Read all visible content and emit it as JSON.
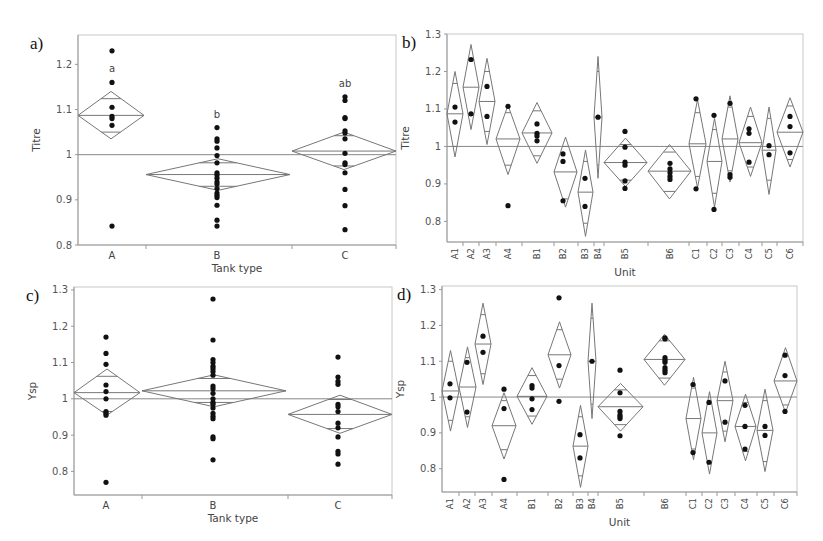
{
  "figure": {
    "panels": [
      "a)",
      "b)",
      "c)",
      "d)"
    ]
  },
  "chart_data": [
    {
      "id": "a",
      "panel_label": "a)",
      "type": "scatter",
      "subtype": "means-diamonds",
      "title": "",
      "xlabel": "Tank type",
      "ylabel": "Titre",
      "ylim": [
        0.8,
        1.26
      ],
      "yticks": [
        {
          "v": 0.8,
          "label": "0.8"
        },
        {
          "v": 0.9,
          "label": "0.9"
        },
        {
          "v": 1.0,
          "label": "1"
        },
        {
          "v": 1.1,
          "label": "1.1"
        },
        {
          "v": 1.2,
          "label": "1.2"
        }
      ],
      "reference_line": 1.0,
      "grid": false,
      "box": {
        "x0": 78,
        "x1": 396,
        "y0": 35,
        "y1": 245,
        "yTop": 1.265,
        "yBot": 0.8
      },
      "categories": [
        {
          "label": "A",
          "sig": "a",
          "cx": 112,
          "left": 78,
          "right": 144,
          "mean": 1.087,
          "ci": [
            1.035,
            1.14
          ],
          "inner": [
            1.05,
            1.124
          ],
          "points": [
            1.23,
            1.16,
            1.105,
            1.085,
            1.08,
            1.065,
            0.842
          ]
        },
        {
          "label": "B",
          "sig": "b",
          "cx": 217,
          "left": 146,
          "right": 290,
          "mean": 0.956,
          "ci": [
            0.921,
            0.991
          ],
          "inner": [
            0.93,
            0.982
          ],
          "points": [
            1.06,
            1.035,
            1.03,
            1.015,
            0.998,
            0.982,
            0.96,
            0.955,
            0.948,
            0.94,
            0.935,
            0.925,
            0.915,
            0.91,
            0.905,
            0.888,
            0.855,
            0.842
          ]
        },
        {
          "label": "C",
          "sig": "ab",
          "cx": 345,
          "left": 292,
          "right": 396,
          "mean": 1.008,
          "ci": [
            0.967,
            1.05
          ],
          "inner": [
            0.975,
            1.042
          ],
          "points": [
            1.128,
            1.12,
            1.082,
            1.08,
            1.053,
            1.048,
            1.035,
            1.003,
            0.982,
            0.978,
            0.96,
            0.923,
            0.887,
            0.834
          ]
        }
      ]
    },
    {
      "id": "b",
      "panel_label": "b)",
      "type": "scatter",
      "subtype": "means-diamonds",
      "title": "",
      "xlabel": "Unit",
      "ylabel": "Titre",
      "ylim": [
        0.75,
        1.3
      ],
      "yticks": [
        {
          "v": 0.8,
          "label": "0.8"
        },
        {
          "v": 0.9,
          "label": "0.9"
        },
        {
          "v": 1.0,
          "label": "1"
        },
        {
          "v": 1.1,
          "label": "1.1"
        },
        {
          "v": 1.2,
          "label": "1.2"
        },
        {
          "v": 1.3,
          "label": "1.3"
        }
      ],
      "reference_line": 1.0,
      "grid": false,
      "box": {
        "x0": 447,
        "x1": 803,
        "y0": 34,
        "y1": 242,
        "yTop": 1.3,
        "yBot": 0.745
      },
      "categories": [
        {
          "label": "A1",
          "cx": 455,
          "left": 447,
          "right": 463,
          "mean": 1.087,
          "ci": [
            0.972,
            1.2
          ],
          "inner": [
            1.0,
            1.168
          ],
          "points": [
            1.105,
            1.065
          ]
        },
        {
          "label": "A2",
          "cx": 471,
          "left": 463,
          "right": 479,
          "mean": 1.158,
          "ci": [
            1.045,
            1.272
          ],
          "inner": [
            1.085,
            1.23
          ],
          "points": [
            1.232,
            1.087
          ]
        },
        {
          "label": "A3",
          "cx": 487,
          "left": 479,
          "right": 495,
          "mean": 1.12,
          "ci": [
            1.005,
            1.235
          ],
          "inner": [
            1.04,
            1.2
          ],
          "points": [
            1.16,
            1.08
          ]
        },
        {
          "label": "A4",
          "cx": 508,
          "left": 496,
          "right": 520,
          "mean": 1.02,
          "ci": [
            0.925,
            1.11
          ],
          "inner": [
            0.95,
            1.09
          ],
          "points": [
            1.107,
            0.842
          ]
        },
        {
          "label": "B1",
          "cx": 537,
          "left": 522,
          "right": 552,
          "mean": 1.036,
          "ci": [
            0.955,
            1.117
          ],
          "inner": [
            0.975,
            1.095
          ],
          "points": [
            1.06,
            1.035,
            1.028,
            1.015
          ]
        },
        {
          "label": "B2",
          "cx": 563,
          "left": 554,
          "right": 577,
          "mean": 0.932,
          "ci": [
            0.838,
            1.025
          ],
          "inner": [
            0.86,
            1.0
          ],
          "points": [
            0.98,
            0.96,
            0.855
          ]
        },
        {
          "label": "B3",
          "cx": 585,
          "left": 578,
          "right": 593,
          "mean": 0.878,
          "ci": [
            0.76,
            0.99
          ],
          "inner": [
            0.795,
            0.96
          ],
          "points": [
            0.915,
            0.84
          ]
        },
        {
          "label": "B4",
          "cx": 598,
          "left": 594,
          "right": 602,
          "mean": 1.078,
          "ci": [
            0.915,
            1.24
          ],
          "inner": [
            0.95,
            1.2
          ],
          "points": [
            1.078
          ]
        },
        {
          "label": "B5",
          "cx": 625,
          "left": 604,
          "right": 647,
          "mean": 0.957,
          "ci": [
            0.893,
            1.022
          ],
          "inner": [
            0.91,
            1.005
          ],
          "points": [
            1.04,
            0.998,
            0.958,
            0.95,
            0.908,
            0.888
          ]
        },
        {
          "label": "B6",
          "cx": 670,
          "left": 648,
          "right": 691,
          "mean": 0.934,
          "ci": [
            0.86,
            1.005
          ],
          "inner": [
            0.88,
            0.985
          ],
          "points": [
            0.955,
            0.94,
            0.93,
            0.92,
            0.912
          ]
        },
        {
          "label": "C1",
          "cx": 696,
          "left": 689,
          "right": 706,
          "mean": 1.007,
          "ci": [
            0.89,
            1.125
          ],
          "inner": [
            0.92,
            1.09
          ],
          "points": [
            1.127,
            0.887
          ]
        },
        {
          "label": "C2",
          "cx": 714,
          "left": 707,
          "right": 722,
          "mean": 0.96,
          "ci": [
            0.838,
            1.075
          ],
          "inner": [
            0.875,
            1.045
          ],
          "points": [
            1.083,
            0.832
          ]
        },
        {
          "label": "C3",
          "cx": 730,
          "left": 722,
          "right": 738,
          "mean": 1.02,
          "ci": [
            0.905,
            1.135
          ],
          "inner": [
            0.935,
            1.105
          ],
          "points": [
            1.115,
            0.925,
            0.918
          ]
        },
        {
          "label": "C4",
          "cx": 749,
          "left": 739,
          "right": 762,
          "mean": 1.01,
          "ci": [
            0.92,
            1.105
          ],
          "inner": [
            0.945,
            1.08
          ],
          "points": [
            1.047,
            1.035,
            0.958
          ]
        },
        {
          "label": "C5",
          "cx": 769,
          "left": 762,
          "right": 776,
          "mean": 0.99,
          "ci": [
            0.872,
            1.105
          ],
          "inner": [
            0.91,
            1.075
          ],
          "points": [
            1.002,
            0.978
          ]
        },
        {
          "label": "C6",
          "cx": 790,
          "left": 777,
          "right": 803,
          "mean": 1.038,
          "ci": [
            0.945,
            1.13
          ],
          "inner": [
            0.965,
            1.108
          ],
          "points": [
            1.08,
            1.053,
            0.983
          ]
        }
      ]
    },
    {
      "id": "c",
      "panel_label": "c)",
      "type": "scatter",
      "subtype": "means-diamonds",
      "title": "",
      "xlabel": "Tank type",
      "ylabel": "Ysp",
      "ylim": [
        0.75,
        1.3
      ],
      "yticks": [
        {
          "v": 0.8,
          "label": "0.8"
        },
        {
          "v": 0.9,
          "label": "0.9"
        },
        {
          "v": 1.0,
          "label": "1"
        },
        {
          "v": 1.1,
          "label": "1.1"
        },
        {
          "v": 1.2,
          "label": "1.2"
        },
        {
          "v": 1.3,
          "label": "1.3"
        }
      ],
      "reference_line": 1.0,
      "grid": false,
      "box": {
        "x0": 74,
        "x1": 392,
        "y0": 287,
        "y1": 495,
        "yTop": 1.308,
        "yBot": 0.735
      },
      "categories": [
        {
          "label": "A",
          "cx": 106,
          "left": 74,
          "right": 140,
          "mean": 1.017,
          "ci": [
            0.955,
            1.082
          ],
          "inner": [
            0.965,
            1.062
          ],
          "points": [
            1.17,
            1.125,
            1.095,
            1.038,
            1.02,
            1.0,
            0.965,
            0.96,
            0.955,
            0.77
          ]
        },
        {
          "label": "B",
          "cx": 213,
          "left": 142,
          "right": 286,
          "mean": 1.022,
          "ci": [
            0.978,
            1.066
          ],
          "inner": [
            0.99,
            1.056
          ],
          "points": [
            1.275,
            1.162,
            1.108,
            1.1,
            1.09,
            1.083,
            1.075,
            1.065,
            1.035,
            1.028,
            1.015,
            1.0,
            0.99,
            0.985,
            0.975,
            0.96,
            0.952,
            0.945,
            0.895,
            0.89,
            0.832
          ]
        },
        {
          "label": "C",
          "cx": 338,
          "left": 288,
          "right": 392,
          "mean": 0.957,
          "ci": [
            0.905,
            1.01
          ],
          "inner": [
            0.918,
            0.998
          ],
          "points": [
            1.115,
            1.06,
            1.048,
            1.04,
            0.985,
            0.978,
            0.965,
            0.933,
            0.92,
            0.895,
            0.855,
            0.848,
            0.82
          ]
        }
      ]
    },
    {
      "id": "d",
      "panel_label": "d)",
      "type": "scatter",
      "subtype": "means-diamonds",
      "title": "",
      "xlabel": "Unit",
      "ylabel": "Ysp",
      "ylim": [
        0.75,
        1.3
      ],
      "yticks": [
        {
          "v": 0.8,
          "label": "0.8"
        },
        {
          "v": 0.9,
          "label": "0.9"
        },
        {
          "v": 1.0,
          "label": "1"
        },
        {
          "v": 1.1,
          "label": "1.1"
        },
        {
          "v": 1.2,
          "label": "1.2"
        },
        {
          "v": 1.3,
          "label": "1.3"
        }
      ],
      "reference_line": 1.0,
      "grid": false,
      "box": {
        "x0": 442,
        "x1": 797,
        "y0": 286,
        "y1": 492,
        "yTop": 1.31,
        "yBot": 0.735
      },
      "categories": [
        {
          "label": "A1",
          "cx": 450,
          "left": 442,
          "right": 459,
          "mean": 1.017,
          "ci": [
            0.905,
            1.13
          ],
          "inner": [
            0.935,
            1.1
          ],
          "points": [
            1.037,
            0.998
          ]
        },
        {
          "label": "A2",
          "cx": 467,
          "left": 459,
          "right": 476,
          "mean": 1.028,
          "ci": [
            0.915,
            1.14
          ],
          "inner": [
            0.945,
            1.11
          ],
          "points": [
            1.097,
            0.958
          ]
        },
        {
          "label": "A3",
          "cx": 483,
          "left": 475,
          "right": 491,
          "mean": 1.148,
          "ci": [
            1.035,
            1.262
          ],
          "inner": [
            1.065,
            1.23
          ],
          "points": [
            1.17,
            1.125
          ]
        },
        {
          "label": "A4",
          "cx": 504,
          "left": 492,
          "right": 516,
          "mean": 0.92,
          "ci": [
            0.827,
            1.012
          ],
          "inner": [
            0.853,
            0.99
          ],
          "points": [
            1.022,
            0.968,
            0.77
          ]
        },
        {
          "label": "B1",
          "cx": 532,
          "left": 517,
          "right": 547,
          "mean": 1.002,
          "ci": [
            0.924,
            1.082
          ],
          "inner": [
            0.947,
            1.06
          ],
          "points": [
            1.032,
            1.025,
            0.995,
            0.965
          ]
        },
        {
          "label": "B2",
          "cx": 559,
          "left": 548,
          "right": 571,
          "mean": 1.118,
          "ci": [
            1.025,
            1.21
          ],
          "inner": [
            1.05,
            1.188
          ],
          "points": [
            1.277,
            1.088,
            0.988
          ]
        },
        {
          "label": "B3",
          "cx": 580,
          "left": 573,
          "right": 588,
          "mean": 0.863,
          "ci": [
            0.748,
            0.977
          ],
          "inner": [
            0.78,
            0.945
          ],
          "points": [
            0.895,
            0.83
          ]
        },
        {
          "label": "B4",
          "cx": 592,
          "left": 588,
          "right": 596,
          "mean": 1.1,
          "ci": [
            0.94,
            1.262
          ],
          "inner": [
            0.98,
            1.22
          ],
          "points": [
            1.1
          ]
        },
        {
          "label": "B5",
          "cx": 620,
          "left": 598,
          "right": 643,
          "mean": 0.973,
          "ci": [
            0.905,
            1.038
          ],
          "inner": [
            0.923,
            1.02
          ],
          "points": [
            1.075,
            1.012,
            0.96,
            0.95,
            0.945,
            0.94,
            0.892
          ]
        },
        {
          "label": "B6",
          "cx": 665,
          "left": 644,
          "right": 685,
          "mean": 1.105,
          "ci": [
            1.033,
            1.175
          ],
          "inner": [
            1.053,
            1.157
          ],
          "points": [
            1.165,
            1.162,
            1.11,
            1.103,
            1.097,
            1.082,
            1.075,
            1.068
          ]
        },
        {
          "label": "C1",
          "cx": 693,
          "left": 686,
          "right": 701,
          "mean": 0.94,
          "ci": [
            0.825,
            1.055
          ],
          "inner": [
            0.855,
            1.025
          ],
          "points": [
            1.035,
            0.845
          ]
        },
        {
          "label": "C2",
          "cx": 709,
          "left": 702,
          "right": 717,
          "mean": 0.9,
          "ci": [
            0.785,
            1.015
          ],
          "inner": [
            0.817,
            0.985
          ],
          "points": [
            0.985,
            0.818
          ]
        },
        {
          "label": "C3",
          "cx": 725,
          "left": 717,
          "right": 733,
          "mean": 0.99,
          "ci": [
            0.875,
            1.1
          ],
          "inner": [
            0.905,
            1.07
          ],
          "points": [
            1.045,
            0.93
          ]
        },
        {
          "label": "C4",
          "cx": 745,
          "left": 735,
          "right": 756,
          "mean": 0.918,
          "ci": [
            0.822,
            1.008
          ],
          "inner": [
            0.848,
            0.985
          ],
          "points": [
            0.977,
            0.918,
            0.855
          ]
        },
        {
          "label": "C5",
          "cx": 765,
          "left": 757,
          "right": 773,
          "mean": 0.907,
          "ci": [
            0.792,
            1.022
          ],
          "inner": [
            0.82,
            0.99
          ],
          "points": [
            0.918,
            0.893
          ]
        },
        {
          "label": "C6",
          "cx": 785,
          "left": 774,
          "right": 797,
          "mean": 1.045,
          "ci": [
            0.957,
            1.138
          ],
          "inner": [
            0.978,
            1.115
          ],
          "points": [
            1.117,
            1.06,
            0.96
          ]
        }
      ]
    }
  ]
}
